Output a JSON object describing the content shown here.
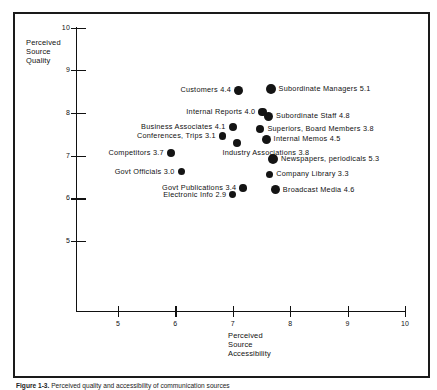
{
  "figure": {
    "caption_prefix": "Figure 1-3.",
    "caption_text": "Perceived quality and accessibility of communication sources"
  },
  "chart_data": {
    "type": "scatter",
    "title": "",
    "xlabel": "Perceived\nSource\nAccessibility",
    "ylabel": "Perceived\nSource\nQuality",
    "xlim": [
      4.5,
      10.0
    ],
    "ylim": [
      4.5,
      10.0
    ],
    "xticks": [
      5,
      6,
      7,
      8,
      9,
      10
    ],
    "yticks": [
      5,
      6,
      7,
      8,
      9,
      10
    ],
    "grid": false,
    "legend": "none",
    "marker_color": "#141414",
    "points": [
      {
        "label": "Customers 4.4",
        "value": 4.4,
        "x": 7.1,
        "y": 8.53,
        "r": 4.4,
        "side": "left"
      },
      {
        "label": "Subordinate Managers 5.1",
        "value": 5.1,
        "x": 7.66,
        "y": 8.56,
        "r": 5.1,
        "side": "right"
      },
      {
        "label": "Internal Reports 4.0",
        "value": 4.0,
        "x": 7.52,
        "y": 8.02,
        "r": 4.0,
        "side": "left"
      },
      {
        "label": "Subordinate Staff 4.8",
        "value": 4.8,
        "x": 7.62,
        "y": 7.92,
        "r": 4.8,
        "side": "right"
      },
      {
        "label": "Business Associates 4.1",
        "value": 4.1,
        "x": 7.0,
        "y": 7.67,
        "r": 4.1,
        "side": "left"
      },
      {
        "label": "Superiors, Board Members 3.8",
        "value": 3.8,
        "x": 7.48,
        "y": 7.63,
        "r": 3.8,
        "side": "right"
      },
      {
        "label": "Conferences, Trips 3.1",
        "value": 3.1,
        "x": 6.82,
        "y": 7.46,
        "r": 3.1,
        "side": "left"
      },
      {
        "label": "Internal Memos 4.5",
        "value": 4.5,
        "x": 7.58,
        "y": 7.38,
        "r": 4.5,
        "side": "right"
      },
      {
        "label": "Industry Associations 3.8",
        "value": 3.8,
        "x": 7.08,
        "y": 7.3,
        "r": 3.8,
        "side": "below"
      },
      {
        "label": "Competitors 3.7",
        "value": 3.7,
        "x": 5.92,
        "y": 7.06,
        "r": 3.7,
        "side": "left"
      },
      {
        "label": "Newspapers, periodicals 5.3",
        "value": 5.3,
        "x": 7.7,
        "y": 6.92,
        "r": 5.3,
        "side": "right"
      },
      {
        "label": "Govt Officials 3.0",
        "value": 3.0,
        "x": 6.1,
        "y": 6.62,
        "r": 3.0,
        "side": "left"
      },
      {
        "label": "Company Library 3.3",
        "value": 3.3,
        "x": 7.64,
        "y": 6.56,
        "r": 3.3,
        "side": "right"
      },
      {
        "label": "Govt Publications 3.4",
        "value": 3.4,
        "x": 7.18,
        "y": 6.24,
        "r": 3.4,
        "side": "left"
      },
      {
        "label": "Broadcast Media 4.6",
        "value": 4.6,
        "x": 7.74,
        "y": 6.2,
        "r": 4.6,
        "side": "right"
      },
      {
        "label": "Electronic Info 2.9",
        "value": 2.9,
        "x": 7.0,
        "y": 6.08,
        "r": 2.9,
        "side": "left"
      }
    ]
  },
  "axes": {
    "x_title_lines": [
      "Perceived",
      "Source",
      "Accessibility"
    ],
    "y_title_lines": [
      "Perceived",
      "Source",
      "Quality"
    ],
    "x_tick_labels": [
      "5",
      "6",
      "7",
      "8",
      "9",
      "10"
    ],
    "y_tick_labels": [
      "10",
      "9",
      "8",
      "7",
      "6",
      "5"
    ]
  }
}
